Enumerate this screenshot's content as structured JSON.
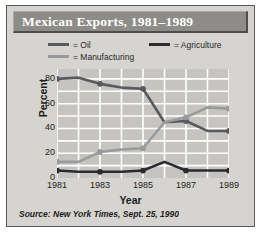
{
  "figure": {
    "title": "Mexican Exports, 1981–1989",
    "source": "Source: New York Times, Sept. 25, 1990"
  },
  "legend": {
    "oil": "= Oil",
    "agriculture": "= Agriculture",
    "manufacturing": "= Manufacturing"
  },
  "colors": {
    "oil": "#5a5a5e",
    "agriculture": "#2b2b2f",
    "manufacturing": "#9a9a9c",
    "plot_background": "#c6c4c0",
    "grid": "#ffffff",
    "card_background": "#d6d4d0",
    "title_banner": "#8d8c89",
    "title_text": "#ffffff",
    "frame": "#5c5a57"
  },
  "chart_data": {
    "type": "line",
    "title": "Mexican Exports, 1981–1989",
    "xlabel": "Year",
    "ylabel": "Percent",
    "x": [
      1981,
      1982,
      1983,
      1984,
      1985,
      1986,
      1987,
      1988,
      1989
    ],
    "xticks": [
      1981,
      1983,
      1985,
      1987,
      1989
    ],
    "xlim": [
      1981,
      1989
    ],
    "yticks": [
      0,
      20,
      40,
      60,
      80
    ],
    "ylim": [
      0,
      88
    ],
    "grid": true,
    "legend_position": "above-plot",
    "markers": "filled-circle",
    "series": [
      {
        "name": "Oil",
        "color": "#5a5a5e",
        "values": [
          80,
          81,
          76,
          73,
          72,
          45,
          46,
          38,
          38
        ]
      },
      {
        "name": "Manufacturing",
        "color": "#9a9a9c",
        "values": [
          13,
          13,
          21,
          23,
          24,
          45,
          49,
          57,
          56
        ]
      },
      {
        "name": "Agriculture",
        "color": "#2b2b2f",
        "values": [
          6,
          5,
          5,
          5,
          6,
          13,
          6,
          6,
          6
        ]
      }
    ]
  }
}
